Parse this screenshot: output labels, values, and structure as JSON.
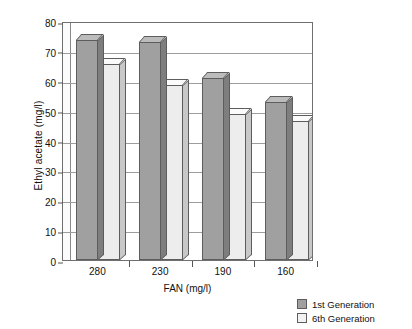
{
  "chart_data": {
    "type": "bar",
    "title": "",
    "xlabel": "FAN (mg/l)",
    "ylabel": "Ethyl acetate (mg/l)",
    "categories": [
      "280",
      "230",
      "190",
      "160"
    ],
    "series": [
      {
        "name": "1st Generation",
        "values": [
          73.5,
          73,
          61,
          53
        ],
        "color": "#a0a0a0"
      },
      {
        "name": "6th Generation",
        "values": [
          65.5,
          58.5,
          49,
          46.5
        ],
        "color": "#ededed"
      }
    ],
    "ylim": [
      0,
      80
    ],
    "ytick_step": 10,
    "yticks": [
      "0",
      "10",
      "20",
      "30",
      "40",
      "50",
      "60",
      "70",
      "80"
    ],
    "grid": true,
    "legend_position": "bottom-right",
    "style": "3d-column"
  },
  "legend": {
    "items": [
      {
        "label": "1st Generation"
      },
      {
        "label": "6th Generation"
      }
    ]
  }
}
